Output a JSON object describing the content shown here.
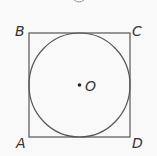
{
  "diagram": {
    "type": "geometry",
    "colors": {
      "background": "#f9f9f9",
      "stroke": "#555555",
      "text": "#333333"
    },
    "square": {
      "vertices": [
        {
          "label": "B",
          "x": 29,
          "y": 33
        },
        {
          "label": "C",
          "x": 130,
          "y": 33
        },
        {
          "label": "D",
          "x": 130,
          "y": 137
        },
        {
          "label": "A",
          "x": 29,
          "y": 137
        }
      ]
    },
    "circle": {
      "center_label": "O",
      "cx": 79.5,
      "cy": 85,
      "r": 51
    },
    "labels": {
      "A": "A",
      "B": "B",
      "C": "C",
      "D": "D",
      "O": "O"
    }
  }
}
